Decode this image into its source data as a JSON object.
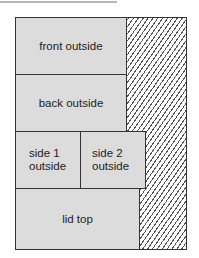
{
  "diagram": {
    "panels": [
      {
        "id": "front",
        "label": "front outside"
      },
      {
        "id": "back",
        "label": "back outside"
      },
      {
        "id": "side1",
        "label": "side 1\noutside",
        "line1": "side 1",
        "line2": "outside"
      },
      {
        "id": "side2",
        "label": "side 2\noutside",
        "line1": "side 2",
        "line2": "outside"
      },
      {
        "id": "lid",
        "label": "lid top"
      }
    ],
    "waste_region": "hatched",
    "colors": {
      "panel_fill": "#dcdcdc",
      "border": "#333333",
      "hatch": "#555555"
    }
  }
}
